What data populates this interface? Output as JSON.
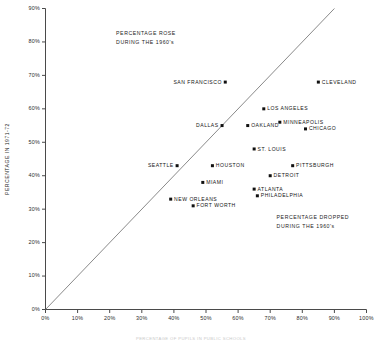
{
  "chart_data": {
    "type": "scatter",
    "title": "",
    "xlabel": "",
    "ylabel": "PERCENTAGE IN 1971-72",
    "xlim": [
      0,
      100
    ],
    "ylim": [
      0,
      90
    ],
    "grid": false,
    "legend": "none",
    "xtick_labels": [
      "0%",
      "10%",
      "20%",
      "30%",
      "40%",
      "50%",
      "60%",
      "70%",
      "80%",
      "90%",
      "100%"
    ],
    "ytick_labels": [
      "0%",
      "10%",
      "20%",
      "30%",
      "40%",
      "50%",
      "60%",
      "70%",
      "80%",
      "90%"
    ],
    "xticks": [
      0,
      10,
      20,
      30,
      40,
      50,
      60,
      70,
      80,
      90,
      100
    ],
    "yticks": [
      0,
      10,
      20,
      30,
      40,
      50,
      60,
      70,
      80,
      90
    ],
    "reference_line": {
      "name": "identity-diagonal",
      "from": [
        0,
        0
      ],
      "to": [
        90,
        90
      ]
    },
    "points": [
      {
        "label": "SAN FRANCISCO",
        "x": 56,
        "y": 68,
        "label_side": "left"
      },
      {
        "label": "CLEVELAND",
        "x": 85,
        "y": 68,
        "label_side": "right"
      },
      {
        "label": "LOS ANGELES",
        "x": 68,
        "y": 60,
        "label_side": "right"
      },
      {
        "label": "MINNEAPOLIS",
        "x": 73,
        "y": 56,
        "label_side": "right"
      },
      {
        "label": "DALLAS",
        "x": 55,
        "y": 55,
        "label_side": "left"
      },
      {
        "label": "OAKLAND",
        "x": 63,
        "y": 55,
        "label_side": "right"
      },
      {
        "label": "CHICAGO",
        "x": 81,
        "y": 54,
        "label_side": "right"
      },
      {
        "label": "ST. LOUIS",
        "x": 65,
        "y": 48,
        "label_side": "right"
      },
      {
        "label": "SEATTLE",
        "x": 41,
        "y": 43,
        "label_side": "left"
      },
      {
        "label": "HOUSTON",
        "x": 52,
        "y": 43,
        "label_side": "right"
      },
      {
        "label": "PITTSBURGH",
        "x": 77,
        "y": 43,
        "label_side": "right"
      },
      {
        "label": "DETROIT",
        "x": 70,
        "y": 40,
        "label_side": "right"
      },
      {
        "label": "MIAMI",
        "x": 49,
        "y": 38,
        "label_side": "right"
      },
      {
        "label": "ATLANTA",
        "x": 65,
        "y": 36,
        "label_side": "right"
      },
      {
        "label": "PHILADELPHIA",
        "x": 66,
        "y": 34,
        "label_side": "right"
      },
      {
        "label": "NEW ORLEANS",
        "x": 39,
        "y": 33,
        "label_side": "right"
      },
      {
        "label": "FORT WORTH",
        "x": 46,
        "y": 31,
        "label_side": "right"
      }
    ],
    "annotations": [
      {
        "name": "percentage-rose-note",
        "lines": [
          "PERCENTAGE ROSE",
          "DURING THE 1960's"
        ],
        "x": 22,
        "y": 82
      },
      {
        "name": "percentage-dropped-note",
        "lines": [
          "PERCENTAGE DROPPED",
          "DURING THE 1960's"
        ],
        "x": 72,
        "y": 27
      }
    ]
  },
  "axes": {
    "y_title": "PERCENTAGE IN 1971-72"
  },
  "caption": {
    "text": "PERCENTAGE OF PUPILS IN PUBLIC SCHOOLS"
  },
  "colors": {
    "point": "#111111",
    "axis": "#4a4a4a",
    "diagonal": "#8a8a8a",
    "text": "#1a1a1a"
  }
}
